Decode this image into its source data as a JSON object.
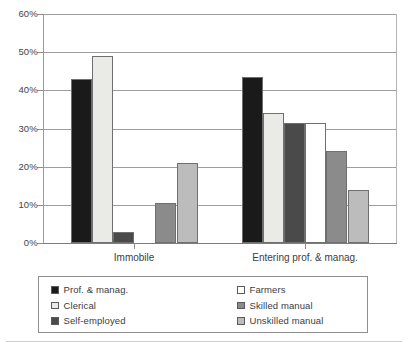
{
  "chart_data": {
    "type": "bar",
    "title": "",
    "xlabel": "",
    "ylabel": "",
    "ylim": [
      0,
      60
    ],
    "ytick_labels": [
      "0%",
      "10%",
      "20%",
      "30%",
      "40%",
      "50%",
      "60%"
    ],
    "ytick_values": [
      0,
      10,
      20,
      30,
      40,
      50,
      60
    ],
    "grid": true,
    "legend_position": "bottom",
    "categories": [
      "Immobile",
      "Entering prof. & manag."
    ],
    "series": [
      {
        "name": "Prof. & manag.",
        "color": "#1a1a1a",
        "values": [
          43.0,
          43.5
        ]
      },
      {
        "name": "Clerical",
        "color": "#eaeae6",
        "values": [
          49.0,
          34.0
        ]
      },
      {
        "name": "Self-employed",
        "color": "#4a4a4a",
        "values": [
          3.0,
          31.5
        ]
      },
      {
        "name": "Farmers",
        "color": "#ffffff",
        "values": [
          0.0,
          31.5
        ]
      },
      {
        "name": "Skilled manual",
        "color": "#8b8b8b",
        "values": [
          10.5,
          24.0
        ]
      },
      {
        "name": "Unskilled manual",
        "color": "#bcbcbc",
        "values": [
          21.0,
          14.0
        ]
      }
    ]
  },
  "legend": {
    "columns": [
      {
        "items": [
          "Prof. & manag.",
          "Clerical",
          "Self-employed"
        ]
      },
      {
        "items": [
          "Farmers",
          "Skilled manual",
          "Unskilled manual"
        ]
      }
    ]
  }
}
